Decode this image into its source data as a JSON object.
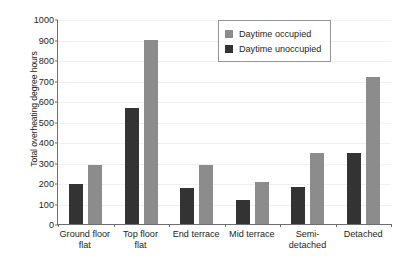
{
  "chart_data": {
    "type": "bar",
    "title": "",
    "xlabel": "",
    "ylabel": "Total overheating degree hours",
    "ylim": [
      0,
      1000
    ],
    "ytick_step": 100,
    "yticks": [
      "1000",
      "900",
      "800",
      "700",
      "600",
      "500",
      "400",
      "300",
      "200",
      "100",
      "0"
    ],
    "grid": true,
    "legend_position": "top-right",
    "categories": [
      "Ground floor flat",
      "Top floor flat",
      "End terrace",
      "Mid terrace",
      "Semi-detached",
      "Detached"
    ],
    "category_lines": [
      [
        "Ground floor",
        "flat"
      ],
      [
        "Top floor",
        "flat"
      ],
      [
        "End terrace",
        ""
      ],
      [
        "Mid terrace",
        ""
      ],
      [
        "Semi-",
        "detached"
      ],
      [
        "Detached",
        ""
      ]
    ],
    "series": [
      {
        "name": "Daytime unoccupied",
        "color": "#333333",
        "values": [
          195,
          565,
          175,
          115,
          180,
          345
        ]
      },
      {
        "name": "Daytime occupied",
        "color": "#8c8c8c",
        "values": [
          290,
          900,
          290,
          205,
          345,
          715
        ]
      }
    ]
  },
  "legend": {
    "entries": [
      {
        "label": "Daytime occupied",
        "color": "#8c8c8c"
      },
      {
        "label": "Daytime unoccupied",
        "color": "#333333"
      }
    ]
  }
}
